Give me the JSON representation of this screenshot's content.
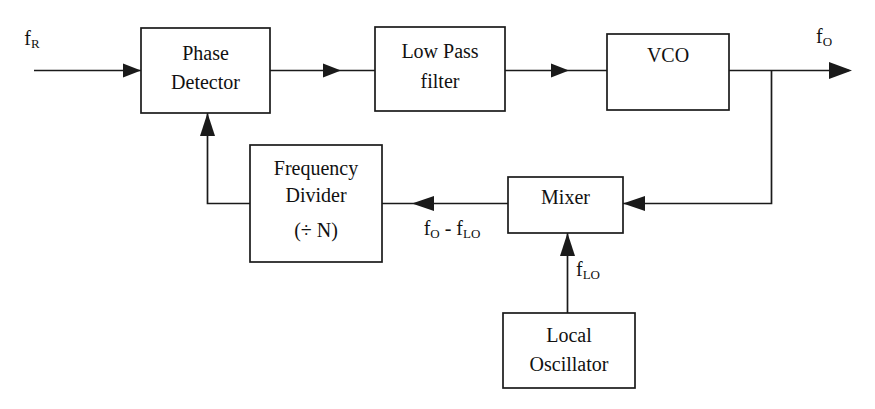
{
  "diagram": {
    "background_color": "#ffffff",
    "line_color": "#1a1a1a",
    "text_color": "#111111",
    "blocks": [
      {
        "id": "phase-detector",
        "line1": "Phase",
        "line2": "Detector",
        "line3": "",
        "x": 141,
        "y": 28,
        "w": 129,
        "h": 85
      },
      {
        "id": "low-pass-filter",
        "line1": "Low Pass",
        "line2": "filter",
        "line3": "",
        "x": 375,
        "y": 27,
        "w": 130,
        "h": 84
      },
      {
        "id": "vco",
        "line1": "VCO",
        "line2": "",
        "line3": "",
        "x": 607,
        "y": 34,
        "w": 122,
        "h": 76
      },
      {
        "id": "frequency-divider",
        "line1": "Frequency",
        "line2": "Divider",
        "line3": "(÷ N)",
        "x": 250,
        "y": 145,
        "w": 132,
        "h": 117
      },
      {
        "id": "mixer",
        "line1": "Mixer",
        "line2": "",
        "line3": "",
        "x": 508,
        "y": 177,
        "w": 115,
        "h": 56
      },
      {
        "id": "local-oscillator",
        "line1": "Local",
        "line2": "Oscillator",
        "line3": "",
        "x": 503,
        "y": 313,
        "w": 132,
        "h": 75
      }
    ],
    "signals": {
      "input_reference": {
        "base": "f",
        "sub": "R",
        "x": 32,
        "y": 40
      },
      "output": {
        "base": "f",
        "sub": "O",
        "x": 830,
        "y": 38
      },
      "mixer_output": {
        "base": "f",
        "sub": "O",
        "base2": " - f",
        "sub2": "LO",
        "x": 452,
        "y": 230
      },
      "local_oscillator_signal": {
        "base": "f",
        "sub": "LO",
        "x": 601,
        "y": 271
      }
    },
    "connections": [
      {
        "id": "ref-to-phase-detector",
        "from": "reference-input",
        "to": "phase-detector"
      },
      {
        "id": "phase-detector-to-lpf",
        "from": "phase-detector",
        "to": "low-pass-filter"
      },
      {
        "id": "lpf-to-vco",
        "from": "low-pass-filter",
        "to": "vco"
      },
      {
        "id": "vco-to-output",
        "from": "vco",
        "to": "output"
      },
      {
        "id": "vco-to-mixer",
        "from": "vco",
        "to": "mixer"
      },
      {
        "id": "mixer-to-frequency-divider",
        "from": "mixer",
        "to": "frequency-divider"
      },
      {
        "id": "frequency-divider-to-phase-detector",
        "from": "frequency-divider",
        "to": "phase-detector"
      },
      {
        "id": "local-oscillator-to-mixer",
        "from": "local-oscillator",
        "to": "mixer"
      }
    ]
  }
}
